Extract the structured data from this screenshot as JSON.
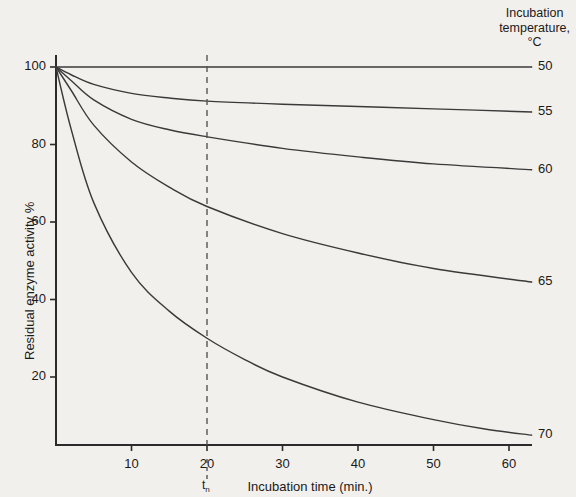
{
  "chart_data": {
    "type": "line",
    "title": "",
    "xlabel": "Incubation time (min.)",
    "ylabel": "Residual enzyme activity %",
    "xlim": [
      0,
      68
    ],
    "ylim": [
      0,
      104
    ],
    "xticks": [
      10,
      20,
      30,
      40,
      50,
      60
    ],
    "yticks": [
      20,
      40,
      60,
      80,
      100
    ],
    "grid": false,
    "legend_position": "right-of-plot",
    "legend_title_lines": [
      "Incubation",
      "temperature,",
      "°C"
    ],
    "annotations": [
      {
        "name": "t-sub-n-marker",
        "type": "vertical-dashed-line",
        "x": 20,
        "label": "t",
        "label_sub": "n"
      }
    ],
    "series": [
      {
        "name": "50",
        "label": "50",
        "points": [
          {
            "x": 0,
            "y": 100
          },
          {
            "x": 5,
            "y": 100
          },
          {
            "x": 10,
            "y": 100
          },
          {
            "x": 20,
            "y": 100
          },
          {
            "x": 30,
            "y": 100
          },
          {
            "x": 40,
            "y": 100
          },
          {
            "x": 50,
            "y": 100
          },
          {
            "x": 63,
            "y": 100
          }
        ]
      },
      {
        "name": "55",
        "label": "55",
        "points": [
          {
            "x": 0,
            "y": 100
          },
          {
            "x": 2,
            "y": 98
          },
          {
            "x": 5,
            "y": 95.5
          },
          {
            "x": 10,
            "y": 93.2
          },
          {
            "x": 15,
            "y": 92
          },
          {
            "x": 20,
            "y": 91.2
          },
          {
            "x": 30,
            "y": 90.4
          },
          {
            "x": 40,
            "y": 89.8
          },
          {
            "x": 50,
            "y": 89.2
          },
          {
            "x": 63,
            "y": 88.4
          }
        ]
      },
      {
        "name": "60",
        "label": "60",
        "points": [
          {
            "x": 0,
            "y": 100
          },
          {
            "x": 2,
            "y": 96.5
          },
          {
            "x": 5,
            "y": 91.5
          },
          {
            "x": 10,
            "y": 86.5
          },
          {
            "x": 15,
            "y": 83.8
          },
          {
            "x": 20,
            "y": 82
          },
          {
            "x": 30,
            "y": 79
          },
          {
            "x": 40,
            "y": 76.8
          },
          {
            "x": 50,
            "y": 75
          },
          {
            "x": 63,
            "y": 73.5
          }
        ]
      },
      {
        "name": "65",
        "label": "65",
        "points": [
          {
            "x": 0,
            "y": 100
          },
          {
            "x": 2,
            "y": 94
          },
          {
            "x": 5,
            "y": 85
          },
          {
            "x": 10,
            "y": 75.5
          },
          {
            "x": 15,
            "y": 69
          },
          {
            "x": 20,
            "y": 64
          },
          {
            "x": 30,
            "y": 57
          },
          {
            "x": 40,
            "y": 52
          },
          {
            "x": 50,
            "y": 48
          },
          {
            "x": 63,
            "y": 44.5
          }
        ]
      },
      {
        "name": "70",
        "label": "70",
        "points": [
          {
            "x": 0,
            "y": 100
          },
          {
            "x": 2,
            "y": 84
          },
          {
            "x": 5,
            "y": 65
          },
          {
            "x": 10,
            "y": 47
          },
          {
            "x": 15,
            "y": 37
          },
          {
            "x": 20,
            "y": 30
          },
          {
            "x": 25,
            "y": 24.5
          },
          {
            "x": 30,
            "y": 20
          },
          {
            "x": 40,
            "y": 13.5
          },
          {
            "x": 50,
            "y": 9
          },
          {
            "x": 57,
            "y": 6.5
          },
          {
            "x": 63,
            "y": 5
          }
        ]
      }
    ]
  },
  "style": {
    "background_color": "#f2f0ec",
    "axis_color": "#2b2b2b",
    "line_color": "#3a3a3a",
    "dashed_line_color": "#555555",
    "text_color": "#1a1a1a"
  }
}
